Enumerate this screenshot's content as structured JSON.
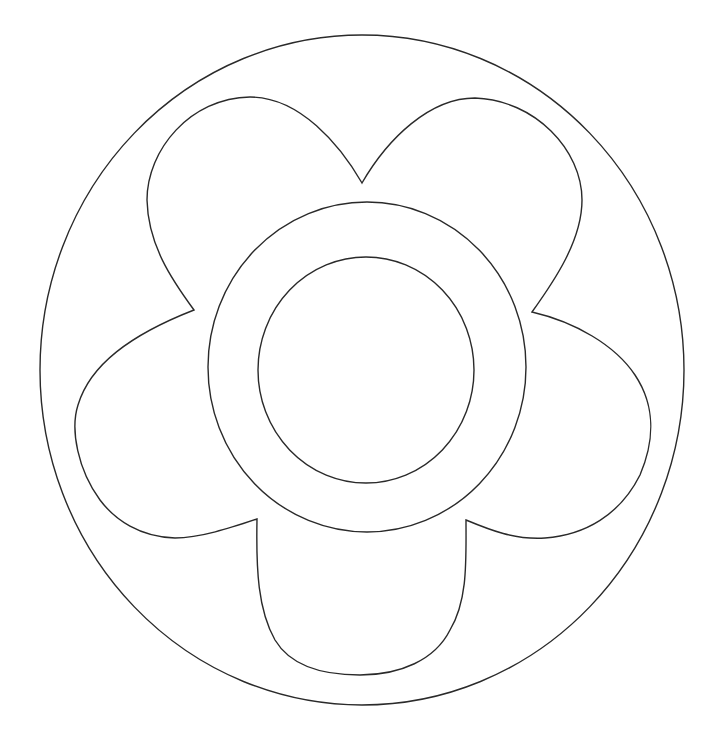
{
  "image": {
    "description": "Coloring-page line drawing of a five-petal flower with a ring center inside a large circle",
    "width": 719,
    "height": 740,
    "background": "#ffffff",
    "stroke_color": "#2a2a2a"
  },
  "shapes": {
    "outer_circle": {
      "cx": 362,
      "cy": 370,
      "rx": 322,
      "ry": 335
    },
    "center_ring_outer": {
      "cx": 367,
      "cy": 367,
      "rx": 159,
      "ry": 165
    },
    "center_inner_circle": {
      "cx": 366,
      "cy": 370,
      "rx": 108,
      "ry": 113
    },
    "petal_count": 5,
    "petal_notches": [
      {
        "name": "top",
        "x": 362,
        "y": 183
      },
      {
        "name": "upper-right",
        "x": 532,
        "y": 312
      },
      {
        "name": "lower-right",
        "x": 466,
        "y": 520
      },
      {
        "name": "lower-left",
        "x": 257,
        "y": 519
      },
      {
        "name": "upper-left",
        "x": 194,
        "y": 310
      }
    ]
  }
}
